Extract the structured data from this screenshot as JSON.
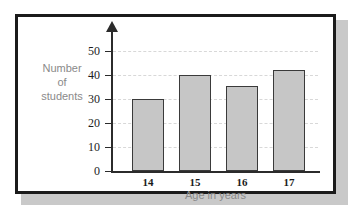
{
  "figure": {
    "frame_color": "#1b1b1b",
    "shadow_color": "#c9c9c9",
    "background": "#ffffff"
  },
  "chart_data": {
    "type": "bar",
    "title": "",
    "subtitle": "",
    "categories": [
      "14",
      "15",
      "16",
      "17"
    ],
    "values": [
      30,
      40,
      35.5,
      42
    ],
    "series": [
      {
        "name": "Number of students",
        "values": [
          30,
          40,
          35.5,
          42
        ]
      }
    ],
    "xlabel": "Age in years",
    "ylabel": "Number of students",
    "ylabel_lines": [
      "Number",
      "of",
      "students"
    ],
    "ylim": [
      0,
      55
    ],
    "yticks": [
      0,
      10,
      20,
      30,
      40,
      50
    ],
    "ytick_labels": [
      "0",
      "10",
      "20",
      "30",
      "40",
      "50"
    ],
    "xtick_labels": [
      "14",
      "15",
      "16",
      "17"
    ],
    "grid": true,
    "grid_style": "dashed",
    "grid_color": "#d8d8d8",
    "legend": false,
    "legend_position": "none",
    "bar_fill": "#c6c6c6",
    "bar_edge": "#3a3a3a",
    "axis_color": "#2b2b2b",
    "axis_label_color": "#8a8a8a",
    "tick_label_color": "#1d1d1d",
    "y_axis_arrow": true,
    "annotations": []
  }
}
